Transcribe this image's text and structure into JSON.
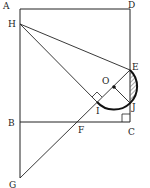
{
  "diagram": {
    "points": {
      "A": {
        "label": "A",
        "x": 20,
        "y": 9,
        "lx": 3,
        "ly": 9
      },
      "D": {
        "label": "D",
        "x": 130,
        "y": 9,
        "lx": 128,
        "ly": 8
      },
      "H": {
        "label": "H",
        "x": 20,
        "y": 24,
        "lx": 8,
        "ly": 27
      },
      "E": {
        "label": "E",
        "x": 130,
        "y": 70,
        "lx": 132,
        "ly": 70
      },
      "O": {
        "label": "O",
        "x": 114,
        "y": 87,
        "lx": 102,
        "ly": 84
      },
      "I": {
        "label": "I",
        "x": 97,
        "y": 102,
        "lx": 96,
        "ly": 114
      },
      "J": {
        "label": "J",
        "x": 130,
        "y": 103,
        "lx": 132,
        "ly": 110
      },
      "C": {
        "label": "C",
        "x": 130,
        "y": 122,
        "lx": 128,
        "ly": 135
      },
      "B": {
        "label": "B",
        "x": 20,
        "y": 122,
        "lx": 8,
        "ly": 126
      },
      "F": {
        "label": "F",
        "x": 78,
        "y": 122,
        "lx": 78,
        "ly": 133
      },
      "G": {
        "label": "G",
        "x": 20,
        "y": 178,
        "lx": 9,
        "ly": 188
      }
    },
    "colors": {
      "line": "#222222",
      "hatch": "#555555"
    }
  }
}
